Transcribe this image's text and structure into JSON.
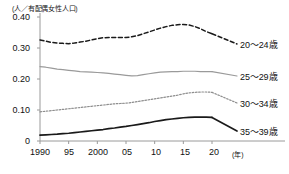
{
  "chart_data": {
    "type": "line",
    "title": "",
    "subtitle": "",
    "ylabel": "(人／有配偶女性人口)",
    "xlabel": "(年)",
    "ylim": [
      0,
      0.4
    ],
    "xlim": [
      1990,
      2021
    ],
    "grid": false,
    "legend_position": "right",
    "yticks": [
      "0.40",
      "0.30",
      "0.20",
      "0.10",
      "0"
    ],
    "ytick_values": [
      0.4,
      0.3,
      0.2,
      0.1,
      0
    ],
    "xticks": [
      "1990",
      "95",
      "2000",
      "05",
      "10",
      "15",
      "20"
    ],
    "xtick_values": [
      1990,
      1995,
      2000,
      2005,
      2010,
      2015,
      2020
    ],
    "x": [
      1990,
      1991,
      1992,
      1993,
      1994,
      1995,
      1996,
      1997,
      1998,
      1999,
      2000,
      2001,
      2002,
      2003,
      2004,
      2005,
      2006,
      2007,
      2008,
      2009,
      2010,
      2011,
      2012,
      2013,
      2014,
      2015,
      2016,
      2017,
      2018,
      2019,
      2020
    ],
    "series": [
      {
        "name": "20～24歳",
        "style": "dashed",
        "color": "#1a1a1a",
        "values": [
          0.326,
          0.322,
          0.318,
          0.316,
          0.315,
          0.314,
          0.316,
          0.319,
          0.322,
          0.326,
          0.33,
          0.333,
          0.334,
          0.334,
          0.334,
          0.334,
          0.336,
          0.34,
          0.346,
          0.352,
          0.358,
          0.364,
          0.369,
          0.373,
          0.375,
          0.376,
          0.374,
          0.369,
          0.362,
          0.353,
          0.346
        ]
      },
      {
        "name": "25～29歳",
        "style": "solid-gray",
        "color": "#9a9a9a",
        "values": [
          0.24,
          0.238,
          0.235,
          0.232,
          0.23,
          0.228,
          0.226,
          0.224,
          0.223,
          0.222,
          0.221,
          0.22,
          0.218,
          0.216,
          0.214,
          0.212,
          0.21,
          0.211,
          0.214,
          0.217,
          0.22,
          0.222,
          0.223,
          0.224,
          0.224,
          0.225,
          0.225,
          0.225,
          0.224,
          0.224,
          0.224
        ]
      },
      {
        "name": "30～34歳",
        "style": "dotted",
        "color": "#8e8e8e",
        "values": [
          0.094,
          0.096,
          0.098,
          0.1,
          0.102,
          0.104,
          0.106,
          0.108,
          0.11,
          0.112,
          0.114,
          0.116,
          0.118,
          0.12,
          0.121,
          0.122,
          0.124,
          0.127,
          0.13,
          0.133,
          0.136,
          0.139,
          0.142,
          0.145,
          0.148,
          0.152,
          0.155,
          0.157,
          0.158,
          0.158,
          0.157
        ]
      },
      {
        "name": "35～39歳",
        "style": "solid-black",
        "color": "#1a1a1a",
        "values": [
          0.019,
          0.02,
          0.021,
          0.022,
          0.024,
          0.025,
          0.027,
          0.029,
          0.031,
          0.033,
          0.035,
          0.037,
          0.04,
          0.042,
          0.045,
          0.047,
          0.05,
          0.053,
          0.056,
          0.059,
          0.063,
          0.066,
          0.069,
          0.071,
          0.073,
          0.075,
          0.076,
          0.077,
          0.077,
          0.077,
          0.076
        ]
      }
    ],
    "legend": [
      {
        "label": "20～24歳",
        "style": "dashed",
        "color": "#1a1a1a"
      },
      {
        "label": "25～29歳",
        "style": "solid-gray",
        "color": "#9a9a9a"
      },
      {
        "label": "30～34歳",
        "style": "dotted",
        "color": "#8e8e8e"
      },
      {
        "label": "35～39歳",
        "style": "solid-black",
        "color": "#1a1a1a"
      }
    ]
  }
}
